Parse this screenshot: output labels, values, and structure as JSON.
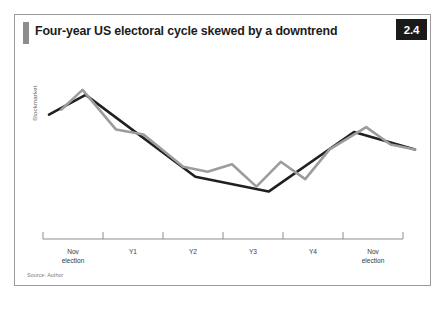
{
  "figure": {
    "title": "Four-year US electoral cycle skewed by a downtrend",
    "badge": "2.4",
    "source": "Source: Author",
    "accent_color": "#8d8d8d",
    "badge_bg": "#1a1a1a",
    "border_color": "#9a9a9a"
  },
  "chart_data": {
    "type": "line",
    "title": "Four-year US electoral cycle skewed by a downtrend",
    "xlabel": "",
    "ylabel": "Stockmarket",
    "grid": false,
    "legend": "none",
    "axis": {
      "x_axis_visible": true,
      "y_axis_visible": false,
      "x_tick_count": 7,
      "ylim": [
        0,
        100
      ],
      "xlim": [
        0,
        48
      ]
    },
    "tick_labels": [
      {
        "line1": "Nov",
        "line2": "election"
      },
      {
        "line1": "Y1",
        "line2": ""
      },
      {
        "line1": "Y2",
        "line2": ""
      },
      {
        "line1": "Y3",
        "line2": ""
      },
      {
        "line1": "Y4",
        "line2": ""
      },
      {
        "line1": "Nov",
        "line2": "election"
      }
    ],
    "series": [
      {
        "name": "downtrend",
        "color": "#231f20",
        "width": 2.6,
        "points": [
          [
            0,
            68
          ],
          [
            12,
            84
          ],
          [
            48,
            18
          ],
          [
            72,
            6
          ],
          [
            100,
            54
          ],
          [
            120,
            40
          ]
        ]
      },
      {
        "name": "electoral-cycle",
        "color": "#9c9c9c",
        "width": 2.6,
        "points": [
          [
            4,
            72
          ],
          [
            11,
            88
          ],
          [
            22,
            56
          ],
          [
            31,
            52
          ],
          [
            44,
            26
          ],
          [
            52,
            22
          ],
          [
            60,
            28
          ],
          [
            68,
            10
          ],
          [
            76,
            30
          ],
          [
            84,
            16
          ],
          [
            92,
            40
          ],
          [
            104,
            58
          ],
          [
            112,
            44
          ],
          [
            120,
            40
          ]
        ]
      }
    ]
  }
}
